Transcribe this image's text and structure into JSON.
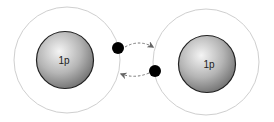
{
  "diagram": {
    "atoms": [
      {
        "name": "left-atom",
        "nucleus_label": "1p",
        "electrons": 1
      },
      {
        "name": "right-atom",
        "nucleus_label": "1p",
        "electrons": 1
      }
    ],
    "arrows": [
      {
        "from": "left-electron",
        "to": "right-atom",
        "style": "dashed"
      },
      {
        "from": "right-electron",
        "to": "left-atom",
        "style": "dashed"
      }
    ],
    "colors": {
      "shell": "#c8c8c8",
      "nucleus_light": "#f2f2f2",
      "nucleus_dark": "#7a7a7a",
      "nucleus_stroke": "#222222",
      "electron": "#000000",
      "arrow": "#666666"
    }
  }
}
